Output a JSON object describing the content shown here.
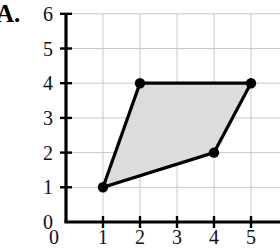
{
  "figure": {
    "panel_label": "A.",
    "colors": {
      "axis": "#000000",
      "grid": "#c8c8c8",
      "polygon_fill": "#dcdcdc",
      "polygon_stroke": "#000000",
      "vertex_marker": "#000000",
      "background": "#ffffff"
    }
  },
  "chart_data": {
    "type": "scatter",
    "title": "A.",
    "xlabel": "",
    "ylabel": "",
    "xlim": [
      0,
      6
    ],
    "ylim": [
      0,
      6
    ],
    "xticks": [
      0,
      1,
      2,
      3,
      4,
      5,
      6
    ],
    "yticks": [
      0,
      1,
      2,
      3,
      4,
      5,
      6
    ],
    "xtick_labels": [
      "0",
      "1",
      "2",
      "3",
      "4",
      "5",
      "6"
    ],
    "ytick_labels": [
      "0",
      "1",
      "2",
      "3",
      "4",
      "5",
      "6"
    ],
    "grid": true,
    "legend": null,
    "shapes": [
      {
        "name": "shaded-quadrilateral",
        "kind": "polygon",
        "closed": true,
        "filled": true,
        "vertices": [
          {
            "x": 1,
            "y": 1
          },
          {
            "x": 2,
            "y": 4
          },
          {
            "x": 5,
            "y": 4
          },
          {
            "x": 4,
            "y": 2
          }
        ],
        "vertex_labels": [
          "(1, 1)",
          "(2, 4)",
          "(5, 4)",
          "(4, 2)"
        ]
      }
    ],
    "annotations": []
  }
}
